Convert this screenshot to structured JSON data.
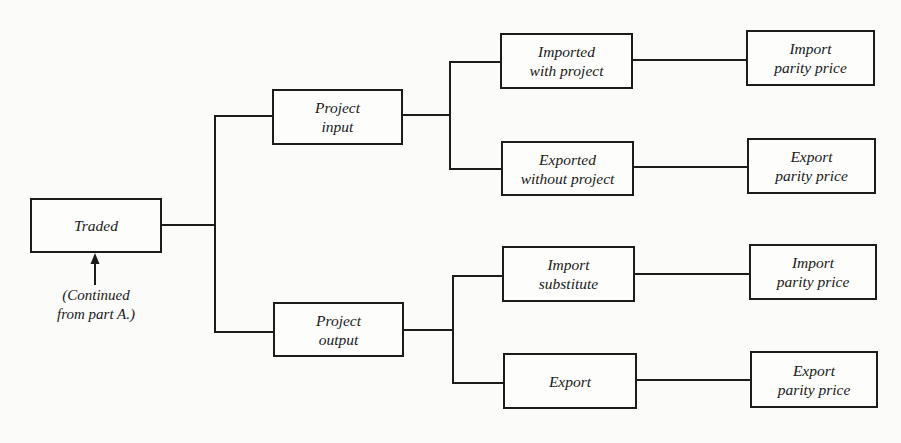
{
  "diagram": {
    "type": "tree",
    "direction": "left-to-right",
    "colors": {
      "background": "#fbfbfa",
      "line": "#1c1c1c",
      "text": "#1a1a1a"
    },
    "root": {
      "id": "traded",
      "lines": [
        "Traded"
      ]
    },
    "note": {
      "lines": [
        "(Continued",
        "from part A.)"
      ],
      "points_to": "traded"
    },
    "level1": [
      {
        "id": "project_input",
        "lines": [
          "Project",
          "input"
        ]
      },
      {
        "id": "project_output",
        "lines": [
          "Project",
          "output"
        ]
      }
    ],
    "level2": [
      {
        "id": "imported_with_project",
        "parent": "project_input",
        "lines": [
          "Imported",
          "with project"
        ]
      },
      {
        "id": "exported_without_project",
        "parent": "project_input",
        "lines": [
          "Exported",
          "without project"
        ]
      },
      {
        "id": "import_substitute",
        "parent": "project_output",
        "lines": [
          "Import",
          "substitute"
        ]
      },
      {
        "id": "export",
        "parent": "project_output",
        "lines": [
          "Export"
        ]
      }
    ],
    "level3": [
      {
        "id": "import_parity_price_1",
        "parent": "imported_with_project",
        "lines": [
          "Import",
          "parity price"
        ]
      },
      {
        "id": "export_parity_price_1",
        "parent": "exported_without_project",
        "lines": [
          "Export",
          "parity price"
        ]
      },
      {
        "id": "import_parity_price_2",
        "parent": "import_substitute",
        "lines": [
          "Import",
          "parity price"
        ]
      },
      {
        "id": "export_parity_price_2",
        "parent": "export",
        "lines": [
          "Export",
          "parity price"
        ]
      }
    ],
    "edges": [
      [
        "traded",
        "project_input"
      ],
      [
        "traded",
        "project_output"
      ],
      [
        "project_input",
        "imported_with_project"
      ],
      [
        "project_input",
        "exported_without_project"
      ],
      [
        "project_output",
        "import_substitute"
      ],
      [
        "project_output",
        "export"
      ],
      [
        "imported_with_project",
        "import_parity_price_1"
      ],
      [
        "exported_without_project",
        "export_parity_price_1"
      ],
      [
        "import_substitute",
        "import_parity_price_2"
      ],
      [
        "export",
        "export_parity_price_2"
      ]
    ]
  }
}
